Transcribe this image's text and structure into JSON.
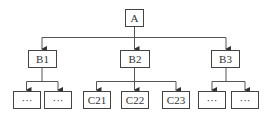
{
  "diagram": {
    "type": "tree",
    "root": {
      "id": "A",
      "label": "A"
    },
    "level1": [
      {
        "id": "B1",
        "label": "B1",
        "children": [
          "…",
          "…"
        ]
      },
      {
        "id": "B2",
        "label": "B2",
        "children": [
          "C21",
          "C22",
          "C23"
        ]
      },
      {
        "id": "B3",
        "label": "B3",
        "children": [
          "…",
          "…"
        ]
      }
    ],
    "nodes": {
      "A": "A",
      "B1": "B1",
      "B2": "B2",
      "B3": "B3",
      "B1_c1": "···",
      "B1_c2": "···",
      "C21": "C21",
      "C22": "C22",
      "C23": "C23",
      "B3_c1": "···",
      "B3_c2": "···"
    },
    "colors": {
      "stroke": "#444444",
      "text": "#333333",
      "background": "#ffffff"
    }
  }
}
